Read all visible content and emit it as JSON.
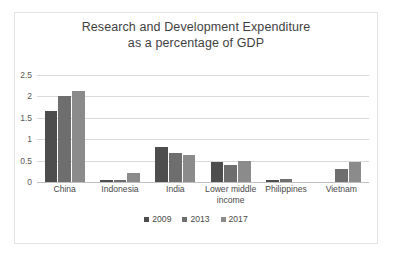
{
  "chart_data": {
    "type": "bar",
    "title": "Research and Development Expenditure as a percentage of GDP",
    "title_lines": [
      "Research and Development Expenditure",
      "as a percentage of GDP"
    ],
    "xlabel": "",
    "ylabel": "",
    "ylim": [
      0,
      2.5
    ],
    "yticks": [
      "0",
      "0.5",
      "1",
      "1.5",
      "2",
      "2.5"
    ],
    "ytick_values": [
      0,
      0.5,
      1,
      1.5,
      2,
      2.5
    ],
    "grid": true,
    "legend_position": "bottom",
    "categories": [
      "China",
      "Indonesia",
      "India",
      "Lower middle income",
      "Philippines",
      "Vietnam"
    ],
    "category_lines": [
      [
        "China"
      ],
      [
        "Indonesia"
      ],
      [
        "India"
      ],
      [
        "Lower middle",
        "income"
      ],
      [
        "Philippines"
      ],
      [
        "Vietnam"
      ]
    ],
    "series": [
      {
        "name": "2009",
        "color": "#4d4d4d",
        "values": [
          1.66,
          0.05,
          0.81,
          0.47,
          0.05,
          null
        ]
      },
      {
        "name": "2013",
        "color": "#6e6e6e",
        "values": [
          2.0,
          0.05,
          0.67,
          0.4,
          0.07,
          0.31
        ]
      },
      {
        "name": "2017",
        "color": "#8b8b8b",
        "values": [
          2.12,
          0.22,
          0.63,
          0.48,
          null,
          0.47
        ]
      }
    ]
  },
  "style": {
    "frame_border": "#e2e2e2",
    "gridline": "#d9d9d9",
    "axis_line": "#bfbfbf",
    "title_color": "#3f3f3f",
    "tick_color": "#595959",
    "label_color": "#4a4a4a",
    "background": "#ffffff"
  }
}
